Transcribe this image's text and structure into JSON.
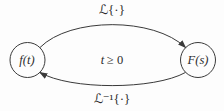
{
  "diagram": {
    "kind": "laplace-transform-pair",
    "nodes": {
      "left": {
        "label": "f(t)"
      },
      "right": {
        "label": "F(s)"
      }
    },
    "edges": {
      "top": {
        "label": "ℒ{·}",
        "direction": "left-to-right"
      },
      "bottom": {
        "label": "ℒ⁻¹{·}",
        "direction": "right-to-left"
      }
    },
    "center_note": {
      "var": "t",
      "condition": "≥ 0"
    }
  },
  "colors": {
    "line": "#3a3a3a",
    "text": "#2c2c2c",
    "background": "#fdfdfd"
  }
}
